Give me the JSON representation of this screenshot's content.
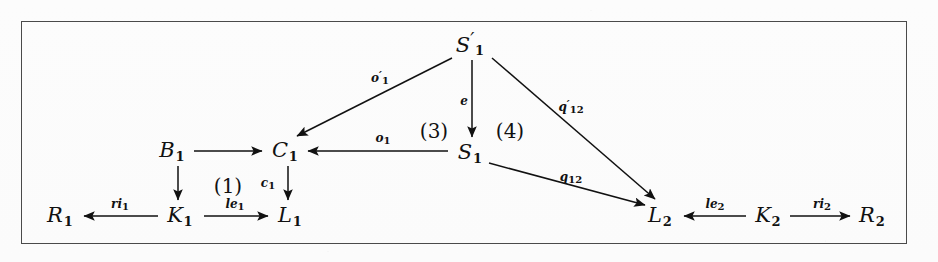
{
  "figure": {
    "type": "commutative-diagram",
    "title_visible": false,
    "border_color": "#4a4a4a",
    "ink_color": "#111111",
    "background_color": "#fdfdfd"
  },
  "nodes": [
    {
      "id": "S1prime",
      "base": "S",
      "prime": "′",
      "sub": "1",
      "x": 470,
      "y": 44
    },
    {
      "id": "B1",
      "base": "B",
      "prime": "",
      "sub": "1",
      "x": 172,
      "y": 151
    },
    {
      "id": "C1",
      "base": "C",
      "prime": "",
      "sub": "1",
      "x": 285,
      "y": 151
    },
    {
      "id": "S1",
      "base": "S",
      "prime": "",
      "sub": "1",
      "x": 470,
      "y": 153
    },
    {
      "id": "R1",
      "base": "R",
      "prime": "",
      "sub": "1",
      "x": 60,
      "y": 216
    },
    {
      "id": "K1",
      "base": "K",
      "prime": "",
      "sub": "1",
      "x": 180,
      "y": 216
    },
    {
      "id": "L1",
      "base": "L",
      "prime": "",
      "sub": "1",
      "x": 290,
      "y": 216
    },
    {
      "id": "L2",
      "base": "L",
      "prime": "",
      "sub": "2",
      "x": 660,
      "y": 216
    },
    {
      "id": "K2",
      "base": "K",
      "prime": "",
      "sub": "2",
      "x": 768,
      "y": 216
    },
    {
      "id": "R2",
      "base": "R",
      "prime": "",
      "sub": "2",
      "x": 872,
      "y": 216
    }
  ],
  "edges": [
    {
      "id": "e-B1-C1",
      "from": "B1",
      "to": "C1",
      "label": "",
      "prime": "",
      "sub": "",
      "label_x": 0,
      "label_y": 0
    },
    {
      "id": "e-B1-K1",
      "from": "B1",
      "to": "K1",
      "label": "",
      "prime": "",
      "sub": "",
      "label_x": 0,
      "label_y": 0
    },
    {
      "id": "e-C1-L1",
      "from": "C1",
      "to": "L1",
      "label": "c",
      "prime": "",
      "sub": "1",
      "label_x": 268,
      "label_y": 184
    },
    {
      "id": "e-K1-R1",
      "from": "K1",
      "to": "R1",
      "label": "ri",
      "prime": "",
      "sub": "1",
      "label_x": 120,
      "label_y": 205
    },
    {
      "id": "e-K1-L1",
      "from": "K1",
      "to": "L1",
      "label": "le",
      "prime": "",
      "sub": "1",
      "label_x": 235,
      "label_y": 205
    },
    {
      "id": "e-S1-C1",
      "from": "S1",
      "to": "C1",
      "label": "o",
      "prime": "",
      "sub": "1",
      "label_x": 383,
      "label_y": 139
    },
    {
      "id": "e-S1prime-C1",
      "from": "S1prime",
      "to": "C1",
      "label": "o",
      "prime": "′",
      "sub": "1",
      "label_x": 380,
      "label_y": 78
    },
    {
      "id": "e-S1prime-S1",
      "from": "S1prime",
      "to": "S1",
      "label": "e",
      "prime": "",
      "sub": "",
      "label_x": 464,
      "label_y": 101
    },
    {
      "id": "e-S1prime-L2",
      "from": "S1prime",
      "to": "L2",
      "label": "q",
      "prime": "′",
      "sub": "12",
      "label_x": 571,
      "label_y": 107
    },
    {
      "id": "e-S1-L2",
      "from": "S1",
      "to": "L2",
      "label": "q",
      "prime": "",
      "sub": "12",
      "label_x": 571,
      "label_y": 178
    },
    {
      "id": "e-K2-L2",
      "from": "K2",
      "to": "L2",
      "label": "le",
      "prime": "",
      "sub": "2",
      "label_x": 715,
      "label_y": 205
    },
    {
      "id": "e-K2-R2",
      "from": "K2",
      "to": "R2",
      "label": "ri",
      "prime": "",
      "sub": "2",
      "label_x": 822,
      "label_y": 205
    }
  ],
  "face_labels": [
    {
      "id": "face-1",
      "text": "(1)",
      "x": 228,
      "y": 186
    },
    {
      "id": "face-3",
      "text": "(3)",
      "x": 434,
      "y": 131
    },
    {
      "id": "face-4",
      "text": "(4)",
      "x": 510,
      "y": 131
    }
  ]
}
